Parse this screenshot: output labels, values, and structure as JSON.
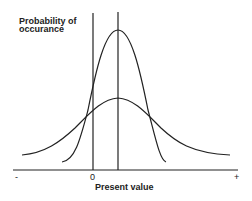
{
  "diagram": {
    "y_axis_label_line1": "Probability of",
    "y_axis_label_line2": "occurance",
    "x_axis_label": "Present value",
    "ticks": {
      "minus": "-",
      "zero": "0",
      "plus": "+"
    },
    "curves": [
      {
        "name": "narrow distribution",
        "peak_x": 118,
        "peak_y": 30
      },
      {
        "name": "wide distribution",
        "peak_x": 118,
        "peak_y": 98
      }
    ],
    "vertical_lines": [
      {
        "name": "zero line",
        "x": 93
      },
      {
        "name": "mean line",
        "x": 118
      }
    ],
    "line_color": "#222222"
  }
}
